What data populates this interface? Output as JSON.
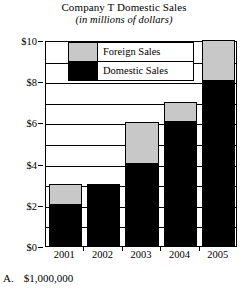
{
  "chart_data": {
    "type": "bar",
    "title": "Company T Domestic Sales",
    "subtitle": "(in millions of dollars)",
    "xlabel": "",
    "ylabel": "",
    "grid": true,
    "stacked": true,
    "legend_position": "inside-top",
    "categories": [
      "2001",
      "2002",
      "2003",
      "2004",
      "2005"
    ],
    "ylim": [
      0,
      10
    ],
    "yticks": [
      0,
      2,
      4,
      6,
      8,
      10
    ],
    "ytick_labels": [
      "$0",
      "$2",
      "$4",
      "$6",
      "$8",
      "$10"
    ],
    "series": [
      {
        "name": "Domestic Sales",
        "color": "#000000",
        "values": [
          2,
          3,
          4,
          6,
          8
        ]
      },
      {
        "name": "Foreign Sales",
        "color": "#c8c8c8",
        "values": [
          1,
          0,
          2,
          1,
          2
        ]
      }
    ],
    "totals": [
      3,
      3,
      6,
      7,
      10
    ]
  },
  "legend": {
    "items": [
      {
        "label": "Foreign Sales",
        "swatch": "gray-swatch"
      },
      {
        "label": "Domestic Sales",
        "swatch": "black-swatch"
      }
    ]
  },
  "answer": {
    "letter": "A.",
    "value": "$1,000,000"
  }
}
